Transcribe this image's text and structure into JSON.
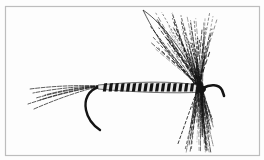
{
  "image": {
    "subject": "dry fly fishing lure illustration",
    "style": "black ink line drawing on white",
    "parts": [
      "tail",
      "hook",
      "segmented-body",
      "wing",
      "hackle",
      "hook-eye"
    ],
    "colors": {
      "ink": "#141414",
      "paper": "#fdfdfd",
      "frame": "#bdbdbd",
      "body_light": "#e8e8e8"
    }
  }
}
